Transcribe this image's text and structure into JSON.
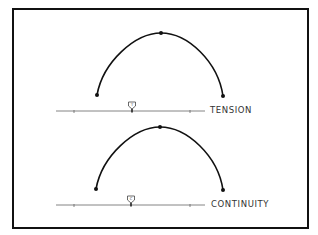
{
  "diagram": {
    "panels": [
      {
        "name": "tension",
        "label": "TENSION",
        "curve": {
          "start": [
            97,
            95
          ],
          "peak": [
            161,
            33
          ],
          "end": [
            223,
            96
          ]
        },
        "slider": {
          "y": 111,
          "x_start": 56,
          "x_end": 205,
          "ticks": [
            74,
            190
          ],
          "thumb_x": 132,
          "thumb_glyph": "T"
        }
      },
      {
        "name": "continuity",
        "label": "CONTINUITY",
        "curve": {
          "start": [
            96,
            189
          ],
          "peak": [
            160,
            127
          ],
          "end": [
            223,
            190
          ]
        },
        "slider": {
          "y": 205,
          "x_start": 56,
          "x_end": 205,
          "ticks": [
            74,
            190
          ],
          "thumb_x": 131,
          "thumb_glyph": "C"
        }
      }
    ],
    "colors": {
      "line": "#111111",
      "background": "#ffffff",
      "slider": "#555555"
    }
  }
}
